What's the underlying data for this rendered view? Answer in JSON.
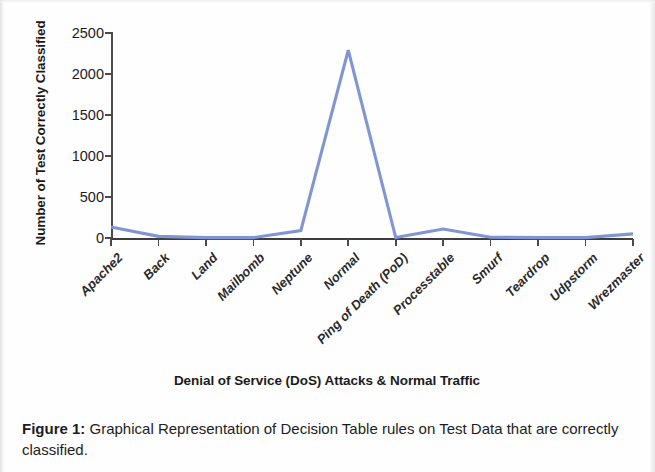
{
  "figure": {
    "caption_label": "Figure 1:",
    "caption_text": " Graphical Representation of Decision Table rules on Test Data that are correctly classified."
  },
  "chart_data": {
    "type": "line",
    "title": "",
    "xlabel": "Denial of Service (DoS) Attacks & Normal Traffic",
    "ylabel": "Number of Test Correctly Classified",
    "categories": [
      "Apache2",
      "Back",
      "Land",
      "Mailbomb",
      "Neptune",
      "Normal",
      "Ping of Death (PoD)",
      "Processtable",
      "Smurf",
      "Teardrop",
      "Udpstorm",
      "Wrezmaster"
    ],
    "values": [
      135,
      20,
      5,
      5,
      90,
      2290,
      5,
      110,
      10,
      5,
      5,
      50
    ],
    "series": [
      {
        "name": "Number of Test Correctly Classified",
        "values": [
          135,
          20,
          5,
          5,
          90,
          2290,
          5,
          110,
          10,
          5,
          5,
          50
        ],
        "color": "#8195d4"
      }
    ],
    "ylim": [
      0,
      2500
    ],
    "y_ticks": [
      0,
      500,
      1000,
      1500,
      2000,
      2500
    ],
    "y_tick_labels": [
      "0",
      "500",
      "1000",
      "1500",
      "2000",
      "2500"
    ],
    "grid": false,
    "legend": false,
    "legend_position": "none",
    "line_color": "#8195d4",
    "axis_color": "#444444"
  }
}
